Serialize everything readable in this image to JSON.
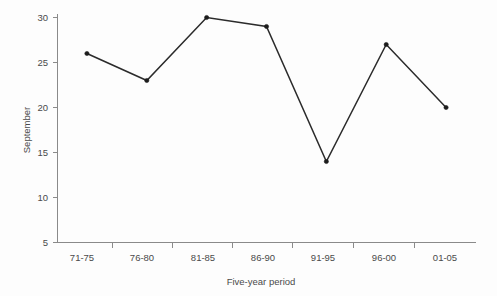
{
  "chart_data": {
    "type": "line",
    "title": "",
    "subtitle": "",
    "xlabel": "Five-year period",
    "ylabel": "September",
    "categories": [
      "71-75",
      "76-80",
      "81-85",
      "86-90",
      "91-95",
      "96-00",
      "01-05"
    ],
    "values": [
      26,
      23,
      30,
      29,
      14,
      27,
      20
    ],
    "series": [
      {
        "name": "September",
        "values": [
          26,
          23,
          30,
          29,
          14,
          27,
          20
        ]
      }
    ],
    "ylim": [
      5,
      30
    ],
    "yticks": [
      5,
      10,
      15,
      20,
      25,
      30
    ],
    "ytick_labels": [
      "5",
      "10",
      "15",
      "20",
      "25",
      "30"
    ],
    "grid": false,
    "legend": false,
    "legend_position": "none",
    "markers": "filled-circle",
    "annotations": [],
    "colors": {
      "line": "#2b2b2b",
      "marker": "#1c1c1c",
      "axis": "#8a8a8a",
      "text": "#4a4a4a",
      "background": "#fdfdfd"
    }
  },
  "axes": {
    "y": {
      "label": "September",
      "ticks": [
        {
          "value": 30,
          "label": "30"
        },
        {
          "value": 25,
          "label": "25"
        },
        {
          "value": 20,
          "label": "20"
        },
        {
          "value": 15,
          "label": "15"
        },
        {
          "value": 10,
          "label": "10"
        },
        {
          "value": 5,
          "label": "5"
        }
      ]
    },
    "x": {
      "label": "Five-year period",
      "ticks": [
        {
          "label": "71-75"
        },
        {
          "label": "76-80"
        },
        {
          "label": "81-85"
        },
        {
          "label": "86-90"
        },
        {
          "label": "91-95"
        },
        {
          "label": "96-00"
        },
        {
          "label": "01-05"
        }
      ]
    }
  }
}
